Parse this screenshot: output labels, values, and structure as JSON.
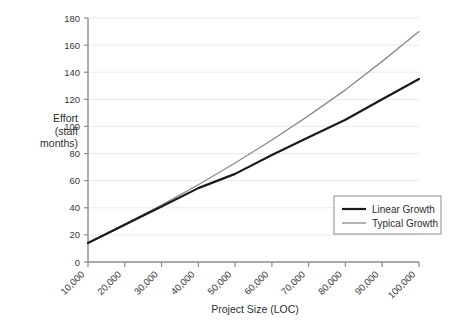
{
  "chart_data": {
    "type": "line",
    "title": "",
    "xlabel": "Project Size (LOC)",
    "ylabel": "Effort (staff months)",
    "ylabel_lines": [
      "Effort",
      "(staff",
      "months)"
    ],
    "x": [
      10000,
      20000,
      30000,
      40000,
      50000,
      60000,
      70000,
      80000,
      90000,
      100000
    ],
    "xtick_labels": [
      "10,000",
      "20,000",
      "30,000",
      "40,000",
      "50,000",
      "60,000",
      "70,000",
      "80,000",
      "90,000",
      "100,000"
    ],
    "ytick_labels": [
      "0",
      "20",
      "40",
      "60",
      "80",
      "100",
      "120",
      "140",
      "160",
      "180"
    ],
    "yticks": [
      0,
      20,
      40,
      60,
      80,
      100,
      120,
      140,
      160,
      180
    ],
    "xlim": [
      10000,
      100000
    ],
    "ylim": [
      0,
      180
    ],
    "grid": "horizontal",
    "legend_position": "lower-right",
    "series": [
      {
        "name": "Linear Growth",
        "color": "#1a1a1a",
        "width": 2.2,
        "values": [
          14,
          27.5,
          41,
          54.5,
          65,
          79,
          92,
          105,
          120,
          135
        ]
      },
      {
        "name": "Typical Growth",
        "color": "#8a8a8a",
        "width": 1.3,
        "values": [
          14,
          28,
          42,
          57,
          73,
          90,
          108,
          127,
          148,
          170
        ]
      }
    ]
  },
  "legend": {
    "items": [
      {
        "label": "Linear Growth",
        "color": "#1a1a1a",
        "width": 2.2
      },
      {
        "label": "Typical Growth",
        "color": "#8a8a8a",
        "width": 1.3
      }
    ]
  },
  "colors": {
    "background": "#ffffff",
    "axis": "#8c8c8c",
    "grid": "#e9e9e9",
    "text": "#2e2e2e",
    "legend_border": "#8c8c8c"
  }
}
